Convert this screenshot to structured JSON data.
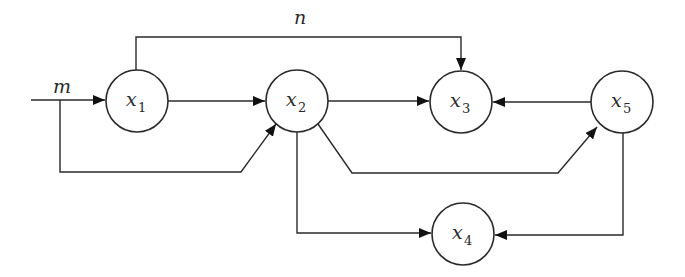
{
  "diagram": {
    "type": "signal-flow-graph",
    "stroke_color": "#2a2a2a",
    "background": "#ffffff",
    "nodes": [
      {
        "id": "x1",
        "var": "x",
        "sub": "1"
      },
      {
        "id": "x2",
        "var": "x",
        "sub": "2"
      },
      {
        "id": "x3",
        "var": "x",
        "sub": "3"
      },
      {
        "id": "x4",
        "var": "x",
        "sub": "4"
      },
      {
        "id": "x5",
        "var": "x",
        "sub": "5"
      }
    ],
    "labels": {
      "input": "m",
      "top_edge": "n"
    },
    "edges": [
      {
        "from": "input",
        "to": "x1",
        "label": "m"
      },
      {
        "from": "input",
        "to": "x2"
      },
      {
        "from": "x1",
        "to": "x2"
      },
      {
        "from": "x1",
        "to": "x3",
        "label": "n"
      },
      {
        "from": "x2",
        "to": "x3"
      },
      {
        "from": "x2",
        "to": "x5"
      },
      {
        "from": "x2",
        "to": "x4"
      },
      {
        "from": "x5",
        "to": "x3"
      },
      {
        "from": "x5",
        "to": "x4"
      }
    ]
  }
}
